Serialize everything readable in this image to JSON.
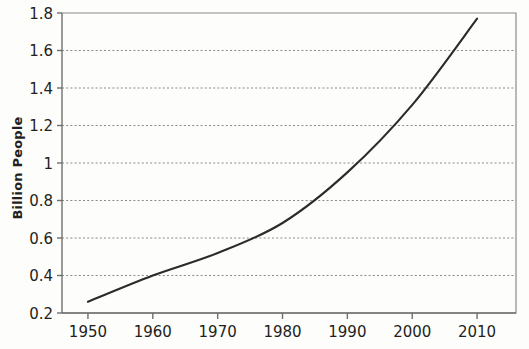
{
  "chart_data": {
    "type": "line",
    "title": "",
    "subtitle": "",
    "xlabel": "",
    "ylabel": "Billion People",
    "x": [
      1950,
      1960,
      1970,
      1980,
      1990,
      2000,
      2010
    ],
    "series": [
      {
        "name": "Population",
        "values": [
          0.26,
          0.4,
          0.52,
          0.68,
          0.95,
          1.31,
          1.77
        ]
      }
    ],
    "xlim": [
      1946,
      2016
    ],
    "ylim": [
      0.2,
      1.8
    ],
    "xticks": [
      1950,
      1960,
      1970,
      1980,
      1990,
      2000,
      2010
    ],
    "xtick_labels": [
      "1950",
      "1960",
      "1970",
      "1980",
      "1990",
      "2000",
      "2010"
    ],
    "yticks": [
      0.2,
      0.4,
      0.6,
      0.8,
      1.0,
      1.2,
      1.4,
      1.6,
      1.8
    ],
    "ytick_labels": [
      "0.2",
      "0.4",
      "0.6",
      "0.8",
      "1",
      "1.2",
      "1.4",
      "1.6",
      "1.8"
    ],
    "grid": "horizontal-dotted",
    "legend": "none",
    "annotations": [],
    "colors": {
      "line": "#2b2b2b",
      "grid": "#8a8a8a",
      "axis": "#6f6f6f",
      "text": "#231f20",
      "background": "#fdfdfc"
    }
  }
}
